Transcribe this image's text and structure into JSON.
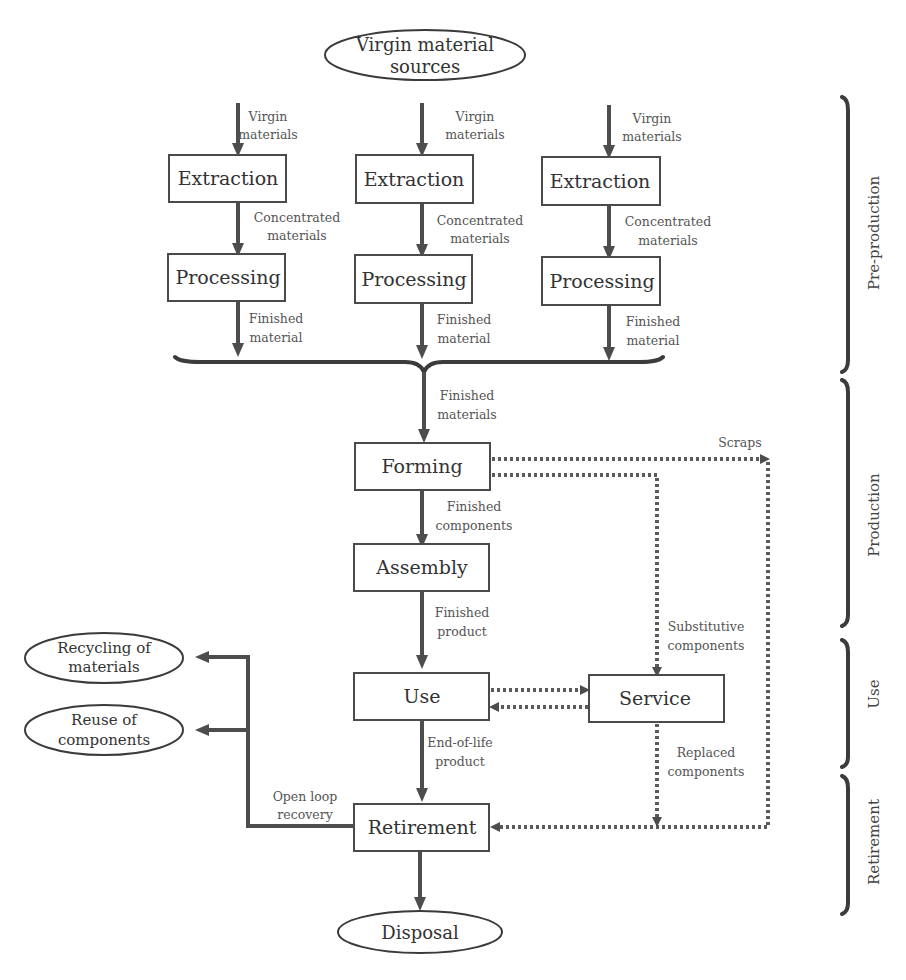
{
  "diagram": {
    "type": "flowchart",
    "sources": {
      "virgin": {
        "line1": "Virgin material",
        "line2": "sources"
      }
    },
    "columns": [
      {
        "input_label": {
          "line1": "Virgin",
          "line2": "materials"
        },
        "extraction": "Extraction",
        "mid_label": {
          "line1": "Concentrated",
          "line2": "materials"
        },
        "processing": "Processing",
        "output_label": {
          "line1": "Finished",
          "line2": "material"
        }
      },
      {
        "input_label": {
          "line1": "Virgin",
          "line2": "materials"
        },
        "extraction": "Extraction",
        "mid_label": {
          "line1": "Concentrated",
          "line2": "materials"
        },
        "processing": "Processing",
        "output_label": {
          "line1": "Finished",
          "line2": "material"
        }
      },
      {
        "input_label": {
          "line1": "Virgin",
          "line2": "materials"
        },
        "extraction": "Extraction",
        "mid_label": {
          "line1": "Concentrated",
          "line2": "materials"
        },
        "processing": "Processing",
        "output_label": {
          "line1": "Finished",
          "line2": "material"
        }
      }
    ],
    "merge_label": {
      "line1": "Finished",
      "line2": "materials"
    },
    "nodes": {
      "forming": "Forming",
      "assembly": "Assembly",
      "use": "Use",
      "service": "Service",
      "retirement": "Retirement",
      "disposal": "Disposal",
      "recycling": {
        "line1": "Recycling of",
        "line2": "materials"
      },
      "reuse": {
        "line1": "Reuse of",
        "line2": "components"
      }
    },
    "edge_labels": {
      "scraps": "Scraps",
      "finished_components": {
        "line1": "Finished",
        "line2": "components"
      },
      "finished_product": {
        "line1": "Finished",
        "line2": "product"
      },
      "substitutive_components": {
        "line1": "Substitutive",
        "line2": "components"
      },
      "end_of_life_product": {
        "line1": "End-of-life",
        "line2": "product"
      },
      "replaced_components": {
        "line1": "Replaced",
        "line2": "components"
      },
      "open_loop_recovery": {
        "line1": "Open loop",
        "line2": "recovery"
      }
    },
    "phases": [
      "Pre-production",
      "Production",
      "Use",
      "Retirement"
    ]
  }
}
